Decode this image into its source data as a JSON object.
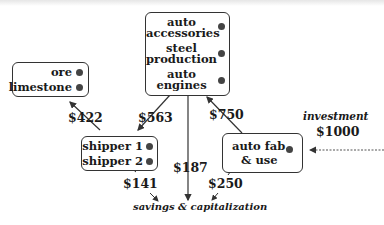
{
  "nodes": {
    "raw": {
      "items": [
        "ore",
        "limestone"
      ]
    },
    "auto": {
      "items": [
        "auto accessories",
        "steel production",
        "auto engines"
      ],
      "lines": [
        "auto",
        "accessories",
        "steel",
        "production",
        "auto",
        "engines"
      ]
    },
    "shippers": {
      "items": [
        "shipper 1",
        "shipper 2"
      ]
    },
    "autofab": {
      "lines": [
        "auto fab.",
        "& use"
      ]
    }
  },
  "flows": {
    "shipper_to_raw": "$422",
    "auto_to_shipper": "$563",
    "autofab_to_auto": "$750",
    "auto_to_savings": "$187",
    "shipper_to_savings": "$141",
    "autofab_to_savings": "$250"
  },
  "investment": {
    "label": "investment",
    "amount": "$1000"
  },
  "sink": {
    "label": "savings & capitalization"
  }
}
